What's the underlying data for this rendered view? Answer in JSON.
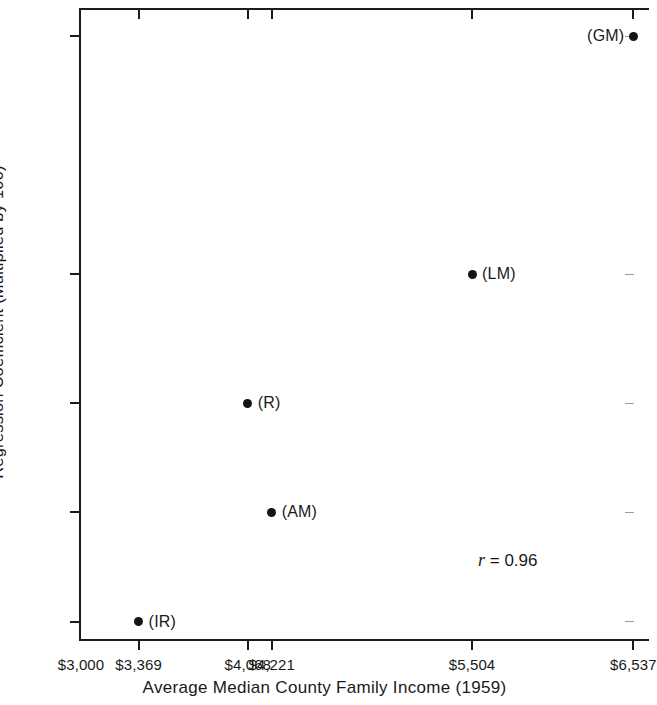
{
  "chart_data": {
    "type": "scatter",
    "title": "",
    "xlabel": "Average Median County Family Income (1959)",
    "ylabel": "Regression Coefficient (Multiplied by 100)",
    "xticklabels": [
      "$3,000",
      "$3,369",
      "$4,068",
      "$4,221",
      "$5,504",
      "$6,537"
    ],
    "xtickvalues": [
      3000,
      3369,
      4068,
      4221,
      5504,
      6537
    ],
    "yticklabels": [
      "0",
      "1.04",
      "6.43",
      "11.78",
      "18.11",
      "29.82"
    ],
    "ytickvalues": [
      0,
      1.04,
      6.43,
      11.78,
      18.11,
      29.82
    ],
    "xlim": [
      3000,
      6650
    ],
    "ylim": [
      0,
      31.1
    ],
    "grid": false,
    "legend": false,
    "points": [
      {
        "label": "(IR)",
        "x": 3369,
        "y": 1.04,
        "label_side": "right"
      },
      {
        "label": "(R)",
        "x": 4068,
        "y": 11.78,
        "label_side": "right"
      },
      {
        "label": "(AM)",
        "x": 4221,
        "y": 6.43,
        "label_side": "right"
      },
      {
        "label": "(LM)",
        "x": 5504,
        "y": 18.11,
        "label_side": "right"
      },
      {
        "label": "(GM)",
        "x": 6537,
        "y": 29.82,
        "label_side": "left"
      }
    ],
    "annotations": [
      {
        "name": "correlation",
        "symbol": "r",
        "text": " = 0.96",
        "full_text": "r = 0.96",
        "value": 0.96
      }
    ],
    "colors": {
      "marker": "#141414",
      "axis": "#1c1c1c",
      "text": "#1a1a1a",
      "background": "#ffffff"
    }
  }
}
